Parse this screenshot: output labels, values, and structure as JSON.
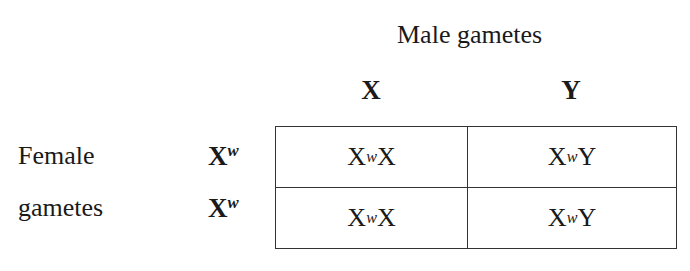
{
  "diagram": {
    "type": "punnett-square",
    "title": "Male gametes",
    "side_label_line1": "Female",
    "side_label_line2": "gametes",
    "columns": [
      {
        "base": "X",
        "sup": ""
      },
      {
        "base": "Y",
        "sup": ""
      }
    ],
    "rows": [
      {
        "base": "X",
        "sup": "w"
      },
      {
        "base": "X",
        "sup": "w"
      }
    ],
    "cells": [
      [
        {
          "pre": "X",
          "sup": "w",
          "post": "X"
        },
        {
          "pre": "X",
          "sup": "w",
          "post": "Y"
        }
      ],
      [
        {
          "pre": "X",
          "sup": "w",
          "post": "X"
        },
        {
          "pre": "X",
          "sup": "w",
          "post": "Y"
        }
      ]
    ]
  }
}
